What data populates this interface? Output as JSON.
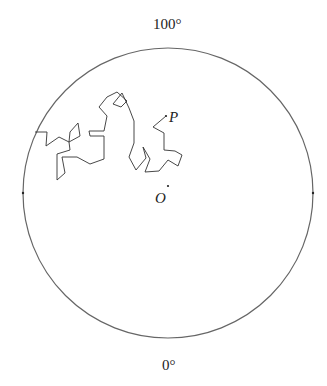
{
  "diagram": {
    "top_label": "100°",
    "bottom_label": "0°",
    "center_label": "O",
    "point_label": "P",
    "circle": {
      "cx": 168,
      "cy": 193,
      "r": 145,
      "stroke": "#666666"
    },
    "path_color": "#333333",
    "walk_points": "35,132 47,132 46,146 59,137 69,142 70,132 78,123 80,136 69,142 70,150 57,154 57,180 65,173 62,157 77,157 90,164 104,159 104,136 90,136 89,131 104,131 107,116 99,107 107,97 117,92 127,101 121,107 113,104 122,93 129,108 134,121 134,143 129,157 136,170 146,158 143,147 150,159 145,172 159,171 168,160 178,166 182,155 175,151 164,150 164,133 153,127 166,116"
  }
}
